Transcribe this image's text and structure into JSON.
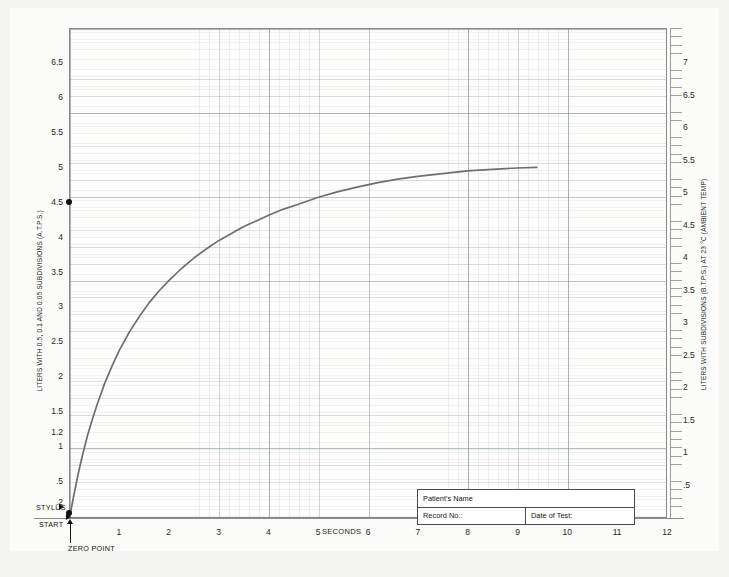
{
  "chart_data": {
    "type": "line",
    "title": "",
    "subtitle": "",
    "xlabel": "SECONDS",
    "ylabel": "LITERS WITH 0.5, 0.1 AND 0.05 SUBDIVISIONS (A.T.P.S.)",
    "ylabel_right": "LITERS WITH SUBDIVISIONS (B.T.P.S.) AT 23 °C (AMBIENT TEMP)",
    "xlim": [
      0,
      12
    ],
    "ylim": [
      0,
      7.0
    ],
    "ylim_right": [
      0,
      7.3
    ],
    "grid": true,
    "legend": "none",
    "x_ticks": [
      "1",
      "2",
      "3",
      "4",
      "5",
      "6",
      "7",
      "8",
      "9",
      "10",
      "11",
      "12"
    ],
    "x_tick_values": [
      1,
      2,
      3,
      4,
      5,
      6,
      7,
      8,
      9,
      10,
      11,
      12
    ],
    "y_ticks_left": [
      "6.5",
      "6",
      "5.5",
      "5",
      "4.5",
      "4",
      "3.5",
      "3",
      "2.5",
      "2",
      "1.5",
      "1.2",
      "1",
      ".5",
      ".2"
    ],
    "y_tick_values_left": [
      6.5,
      6,
      5.5,
      5,
      4.5,
      4,
      3.5,
      3,
      2.5,
      2,
      1.5,
      1.2,
      1,
      0.5,
      0.2
    ],
    "y_ticks_right": [
      "7",
      "6.5",
      "6",
      "5.5",
      "5",
      "4.5",
      "4",
      "3.5",
      "3",
      "2.5",
      "2",
      "1.5",
      "1",
      ".5"
    ],
    "y_tick_values_right": [
      7,
      6.5,
      6,
      5.5,
      5,
      4.5,
      4,
      3.5,
      3,
      2.5,
      2,
      1.5,
      1,
      0.5
    ],
    "series": [
      {
        "name": "Spirogram volume trace",
        "color": "#6e6e6e",
        "x": [
          0.0,
          0.08,
          0.16,
          0.25,
          0.35,
          0.45,
          0.55,
          0.7,
          0.85,
          1.0,
          1.2,
          1.4,
          1.6,
          1.8,
          2.0,
          2.25,
          2.5,
          2.75,
          3.0,
          3.25,
          3.5,
          3.75,
          4.0,
          4.3,
          4.6,
          5.0,
          5.4,
          5.8,
          6.2,
          6.6,
          7.0,
          7.5,
          8.0,
          8.5,
          9.0,
          9.4
        ],
        "y": [
          0.0,
          0.3,
          0.58,
          0.86,
          1.14,
          1.38,
          1.6,
          1.9,
          2.15,
          2.38,
          2.64,
          2.86,
          3.06,
          3.23,
          3.38,
          3.55,
          3.7,
          3.83,
          3.95,
          4.05,
          4.15,
          4.23,
          4.31,
          4.4,
          4.47,
          4.57,
          4.65,
          4.72,
          4.78,
          4.83,
          4.87,
          4.91,
          4.95,
          4.97,
          4.99,
          5.0
        ]
      }
    ],
    "markers": [
      {
        "name": "vital-capacity-marker",
        "label": "4.5",
        "x": 0,
        "y": 4.5,
        "style": "filled-dot-on-axis"
      },
      {
        "name": "zero-point-marker",
        "label": "ZERO POINT",
        "x": 0,
        "y": 0,
        "style": "filled-dot-on-axis"
      }
    ],
    "annotations": [
      {
        "name": "stylus",
        "text": "STYLUS"
      },
      {
        "name": "start",
        "text": "START"
      },
      {
        "name": "zero-point",
        "text": "ZERO POINT"
      },
      {
        "name": "seconds",
        "text": "SECONDS"
      }
    ]
  },
  "axes": {
    "x_label": "SECONDS",
    "left_caption": "LITERS WITH 0.5, 0.1 AND 0.05 SUBDIVISIONS (A.T.P.S.)",
    "right_caption": "LITERS WITH SUBDIVISIONS (B.T.P.S.) AT 23 °C (AMBIENT TEMP)"
  },
  "annotations": {
    "stylus": "STYLUS",
    "start": "START",
    "zero_point": "ZERO POINT"
  },
  "form": {
    "patient_name_label": "Patient's Name",
    "record_no_label": "Record No.:",
    "date_of_test_label": "Date of Test:",
    "patient_name_value": "",
    "record_no_value": "",
    "date_of_test_value": ""
  },
  "colors": {
    "paper": "#fbfbfa",
    "mat": "#f4f4f2",
    "grid_major": "#7885966",
    "curve": "#6e6e6e",
    "axis": "#8a8a8a",
    "text": "#1d1d1d"
  }
}
